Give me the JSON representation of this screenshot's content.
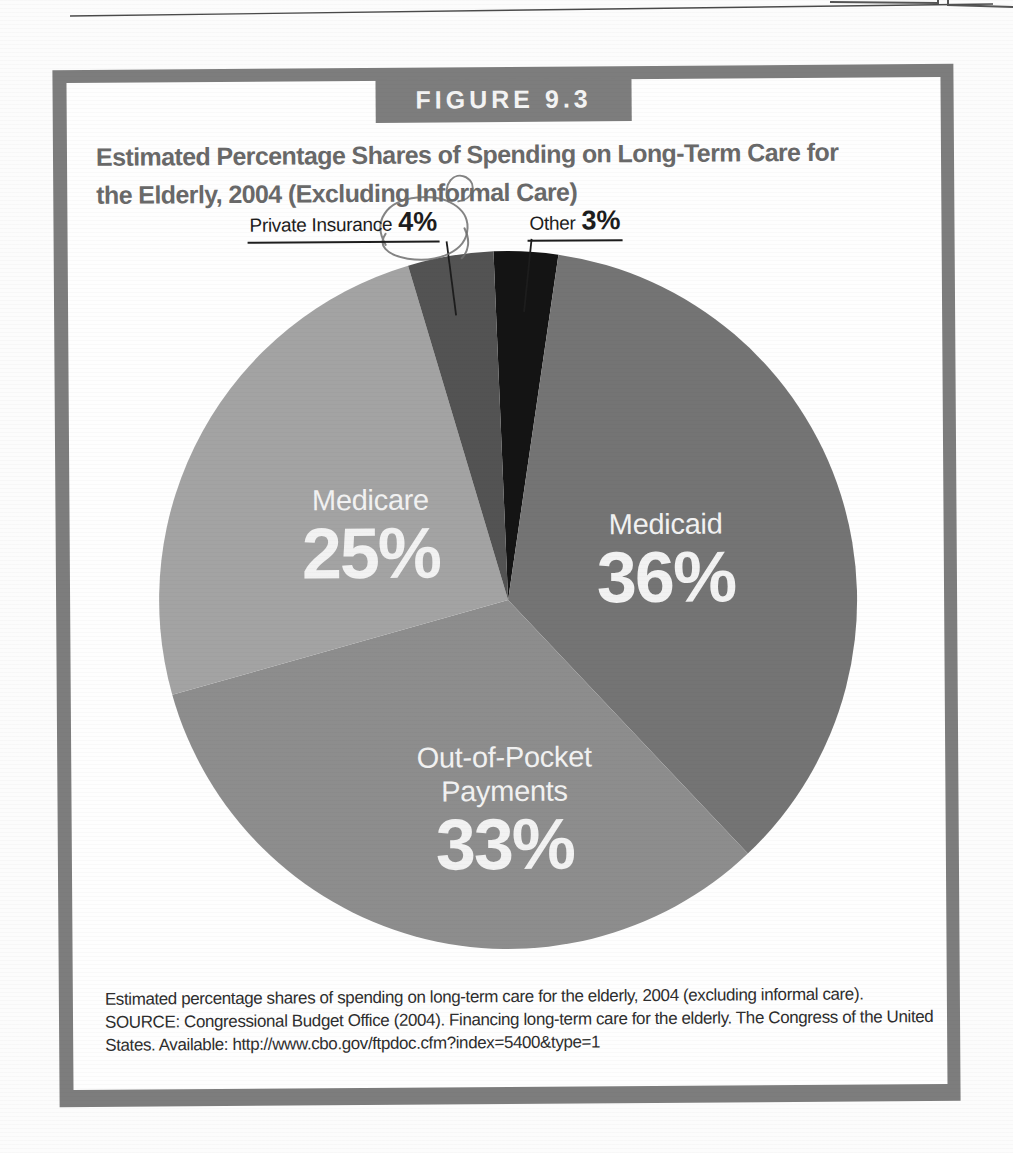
{
  "figure": {
    "tag": "FIGURE 9.3",
    "title_line1": "Estimated Percentage Shares of Spending on Long-Term Care for",
    "title_line2": "the Elderly, 2004 (Excluding Informal Care)",
    "caption_line1": "Estimated percentage shares of spending on long-term care for the elderly, 2004 (excluding informal care).",
    "caption_line2": "SOURCE: Congressional Budget Office (2004). Financing long-term care for the elderly. The Congress of the United",
    "caption_line3": "States. Available: http://www.cbo.gov/ftpdoc.cfm?index=5400&type=1",
    "frame_color": "#7d7d7d"
  },
  "chart_data": {
    "type": "pie",
    "title": "Estimated Percentage Shares of Spending on Long-Term Care for the Elderly, 2004 (Excluding Informal Care)",
    "unit": "percent",
    "direction": "clockwise",
    "start_angle_deg": -2,
    "slices": [
      {
        "label": "Other",
        "value": 3,
        "pct_label": "3%",
        "color": "#141414",
        "label_style": "callout"
      },
      {
        "label": "Medicaid",
        "value": 36,
        "pct_label": "36%",
        "color": "#747474",
        "label_style": "inside"
      },
      {
        "label": "Out-of-Pocket Payments",
        "label_line1": "Out-of-Pocket",
        "label_line2": "Payments",
        "value": 33,
        "pct_label": "33%",
        "color": "#8d8d8d",
        "label_style": "inside"
      },
      {
        "label": "Medicare",
        "value": 25,
        "pct_label": "25%",
        "color": "#a3a3a3",
        "label_style": "inside"
      },
      {
        "label": "Private Insurance",
        "value": 4,
        "pct_label": "4%",
        "color": "#535353",
        "label_style": "callout"
      }
    ],
    "annotations": [
      {
        "type": "pen-circle",
        "target": "Private Insurance 4%"
      }
    ]
  }
}
